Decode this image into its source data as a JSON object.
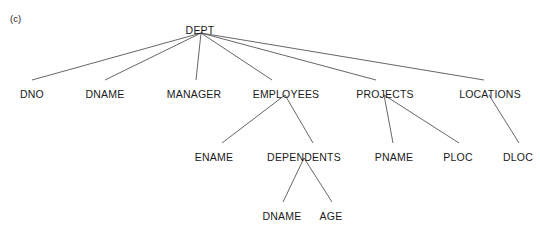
{
  "figure": {
    "caption": "(c)",
    "type": "hierarchy-tree",
    "line_color": "#555555",
    "text_color": "#1a1a1a",
    "background": "#ffffff"
  },
  "chart_data": {
    "type": "tree",
    "title": "(c)",
    "root": "DEPT",
    "nodes": [
      {
        "id": "DEPT",
        "label": "DEPT",
        "level": 0,
        "x": 200,
        "y": 24
      },
      {
        "id": "DNO",
        "label": "DNO",
        "level": 1,
        "x": 32,
        "y": 88
      },
      {
        "id": "DNAME_DEPT",
        "label": "DNAME",
        "level": 1,
        "x": 105,
        "y": 88
      },
      {
        "id": "MANAGER",
        "label": "MANAGER",
        "level": 1,
        "x": 194,
        "y": 88
      },
      {
        "id": "EMPLOYEES",
        "label": "EMPLOYEES",
        "level": 1,
        "x": 286,
        "y": 88
      },
      {
        "id": "PROJECTS",
        "label": "PROJECTS",
        "level": 1,
        "x": 385,
        "y": 88
      },
      {
        "id": "LOCATIONS",
        "label": "LOCATIONS",
        "level": 1,
        "x": 490,
        "y": 88
      },
      {
        "id": "ENAME",
        "label": "ENAME",
        "level": 2,
        "x": 214,
        "y": 151
      },
      {
        "id": "DEPENDENTS",
        "label": "DEPENDENTS",
        "level": 2,
        "x": 304,
        "y": 151
      },
      {
        "id": "PNAME",
        "label": "PNAME",
        "level": 2,
        "x": 394,
        "y": 151
      },
      {
        "id": "PLOC",
        "label": "PLOC",
        "level": 2,
        "x": 458,
        "y": 151
      },
      {
        "id": "DLOC",
        "label": "DLOC",
        "level": 2,
        "x": 518,
        "y": 151
      },
      {
        "id": "DNAME_DEP",
        "label": "DNAME",
        "level": 3,
        "x": 282,
        "y": 210
      },
      {
        "id": "AGE",
        "label": "AGE",
        "level": 3,
        "x": 331,
        "y": 210
      }
    ],
    "edges": [
      {
        "from": "DEPT",
        "to": "DNO",
        "x1": 201,
        "y1": 33,
        "x2": 32,
        "y2": 80
      },
      {
        "from": "DEPT",
        "to": "DNAME_DEPT",
        "x1": 201,
        "y1": 33,
        "x2": 105,
        "y2": 80
      },
      {
        "from": "DEPT",
        "to": "MANAGER",
        "x1": 201,
        "y1": 33,
        "x2": 196,
        "y2": 80
      },
      {
        "from": "DEPT",
        "to": "EMPLOYEES",
        "x1": 201,
        "y1": 33,
        "x2": 272,
        "y2": 80
      },
      {
        "from": "DEPT",
        "to": "PROJECTS",
        "x1": 201,
        "y1": 33,
        "x2": 376,
        "y2": 80
      },
      {
        "from": "DEPT",
        "to": "LOCATIONS",
        "x1": 201,
        "y1": 33,
        "x2": 484,
        "y2": 80
      },
      {
        "from": "EMPLOYEES",
        "to": "ENAME",
        "x1": 285,
        "y1": 95,
        "x2": 222,
        "y2": 143
      },
      {
        "from": "EMPLOYEES",
        "to": "DEPENDENTS",
        "x1": 285,
        "y1": 95,
        "x2": 313,
        "y2": 143
      },
      {
        "from": "PROJECTS",
        "to": "PNAME",
        "x1": 384,
        "y1": 95,
        "x2": 393,
        "y2": 143
      },
      {
        "from": "PROJECTS",
        "to": "PLOC",
        "x1": 384,
        "y1": 95,
        "x2": 459,
        "y2": 143
      },
      {
        "from": "LOCATIONS",
        "to": "DLOC",
        "x1": 489,
        "y1": 95,
        "x2": 519,
        "y2": 143
      },
      {
        "from": "DEPENDENTS",
        "to": "DNAME_DEP",
        "x1": 304,
        "y1": 158,
        "x2": 283,
        "y2": 202
      },
      {
        "from": "DEPENDENTS",
        "to": "AGE",
        "x1": 304,
        "y1": 158,
        "x2": 332,
        "y2": 202
      }
    ]
  }
}
